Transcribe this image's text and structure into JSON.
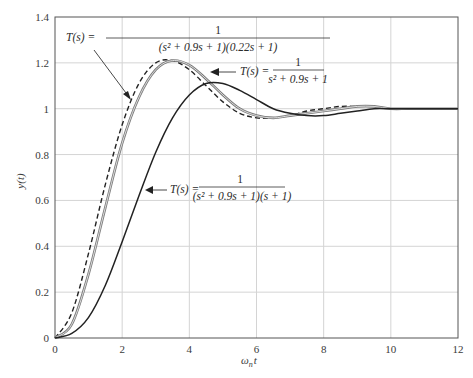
{
  "chart_data": {
    "type": "line",
    "title": "",
    "xlabel": "ωnt",
    "ylabel": "y(t)",
    "xlim": [
      0,
      12
    ],
    "ylim": [
      0,
      1.4
    ],
    "grid": true,
    "x_ticks": [
      "0",
      "2",
      "4",
      "6",
      "8",
      "10",
      "12"
    ],
    "y_ticks": [
      "0",
      "0.2",
      "0.4",
      "0.6",
      "0.8",
      "1",
      "1.2",
      "1.4"
    ],
    "x": [
      0,
      0.5,
      1,
      1.5,
      2,
      2.5,
      3,
      3.5,
      4,
      4.5,
      5,
      5.5,
      6,
      6.5,
      7,
      7.5,
      8,
      8.5,
      9,
      9.5,
      10,
      10.5,
      11,
      11.5,
      12
    ],
    "series": [
      {
        "name": "T(s) = 1/(s^2 + 0.9s + 1)",
        "style": "dashed",
        "color": "#222222",
        "values": [
          0,
          0.11,
          0.37,
          0.67,
          0.93,
          1.11,
          1.2,
          1.21,
          1.17,
          1.1,
          1.03,
          0.98,
          0.96,
          0.96,
          0.97,
          0.99,
          1.0,
          1.01,
          1.01,
          1.01,
          1.0,
          1.0,
          1.0,
          1.0,
          1.0
        ]
      },
      {
        "name": "T(s) = 1/((s^2 + 0.9s + 1)(0.22s + 1))",
        "style": "gray-double",
        "color": "#8a8a8a",
        "values": [
          0,
          0.06,
          0.28,
          0.57,
          0.85,
          1.05,
          1.17,
          1.21,
          1.19,
          1.13,
          1.06,
          1.0,
          0.97,
          0.96,
          0.97,
          0.98,
          0.99,
          1.0,
          1.01,
          1.01,
          1.0,
          1.0,
          1.0,
          1.0,
          1.0
        ]
      },
      {
        "name": "T(s) = 1/((s^2 + 0.9s + 1)(s + 1))",
        "style": "solid",
        "color": "#222222",
        "values": [
          0,
          0.02,
          0.09,
          0.23,
          0.42,
          0.62,
          0.81,
          0.96,
          1.06,
          1.11,
          1.11,
          1.08,
          1.04,
          1.0,
          0.98,
          0.97,
          0.97,
          0.98,
          0.99,
          1.0,
          1.0,
          1.0,
          1.0,
          1.0,
          1.0
        ]
      }
    ],
    "annotations": [
      {
        "text": "T(s) = 1 / ((s^2 + 0.9s + 1)(0.22s + 1))",
        "points_to": "gray curve"
      },
      {
        "text": "T(s) = 1 / (s^2 + 0.9s + 1)",
        "points_to": "dashed curve"
      },
      {
        "text": "T(s) = 1 / ((s^2 + 0.9s + 1)(s + 1))",
        "points_to": "solid dark curve"
      }
    ]
  },
  "labels": {
    "xlabel_main": "ω",
    "xlabel_sub": "n",
    "xlabel_tail": "t",
    "ylabel": "y(t)",
    "ann1_lhs": "T(s) =",
    "ann1_num": "1",
    "ann1_den": "(s² + 0.9s + 1)(0.22s + 1)",
    "ann2_lhs": "T(s) =",
    "ann2_num": "1",
    "ann2_den": "s² + 0.9s + 1",
    "ann3_lhs": "T(s) =",
    "ann3_num": "1",
    "ann3_den": "(s² + 0.9s + 1)(s + 1)"
  }
}
